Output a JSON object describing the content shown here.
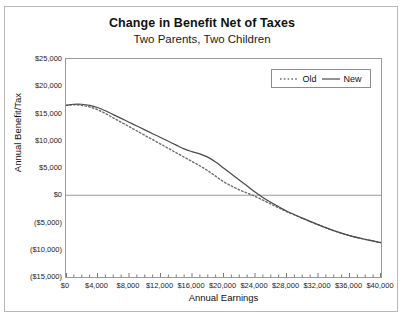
{
  "chart_data": {
    "type": "line",
    "title": "Change in Benefit Net of Taxes",
    "subtitle": "Two Parents, Two Children",
    "xlabel": "Annual Earnings",
    "ylabel": "Annual Benefit/Tax",
    "xlim": [
      0,
      40000
    ],
    "ylim": [
      -15000,
      25000
    ],
    "grid": false,
    "legend_position": "top-right",
    "x_tick_labels": [
      "$0",
      "$4,000",
      "$8,000",
      "$12,000",
      "$16,000",
      "$20,000",
      "$24,000",
      "$28,000",
      "$32,000",
      "$36,000",
      "$40,000"
    ],
    "x_tick_values": [
      0,
      4000,
      8000,
      12000,
      16000,
      20000,
      24000,
      28000,
      32000,
      36000,
      40000
    ],
    "x_minor_tick_interval": 1000,
    "y_tick_labels": [
      "$25,000",
      "$20,000",
      "$15,000",
      "$10,000",
      "$5,000",
      "$0",
      "($5,000)",
      "($10,000)",
      "($15,000)"
    ],
    "y_tick_values": [
      25000,
      20000,
      15000,
      10000,
      5000,
      0,
      -5000,
      -10000,
      -15000
    ],
    "zero_line": 0,
    "series": [
      {
        "name": "Old",
        "style": "dotted",
        "color": "#6e6e6e",
        "x": [
          0,
          1000,
          2000,
          3000,
          4000,
          5000,
          6000,
          7000,
          8000,
          9000,
          10000,
          11000,
          12000,
          13000,
          14000,
          15000,
          16000,
          17000,
          18000,
          19000,
          20000,
          21000,
          22000,
          23000,
          24000,
          25000,
          26000,
          27000,
          28000,
          30000,
          32000,
          34000,
          36000,
          38000,
          40000
        ],
        "y": [
          16500,
          16600,
          16500,
          16200,
          15700,
          15000,
          14200,
          13400,
          12600,
          11800,
          11000,
          10200,
          9400,
          8600,
          7800,
          7000,
          6200,
          5400,
          4500,
          3500,
          2500,
          1700,
          1000,
          400,
          -200,
          -900,
          -1600,
          -2300,
          -3000,
          -4200,
          -5400,
          -6500,
          -7400,
          -8100,
          -8700
        ]
      },
      {
        "name": "New",
        "style": "solid",
        "color": "#4a4a4a",
        "x": [
          0,
          1000,
          2000,
          3000,
          4000,
          5000,
          6000,
          7000,
          8000,
          9000,
          10000,
          11000,
          12000,
          13000,
          14000,
          15000,
          16000,
          17000,
          18000,
          19000,
          20000,
          21000,
          22000,
          23000,
          24000,
          25000,
          26000,
          27000,
          28000,
          30000,
          32000,
          34000,
          36000,
          38000,
          40000
        ],
        "y": [
          16500,
          16700,
          16700,
          16500,
          16100,
          15500,
          14800,
          14100,
          13400,
          12700,
          12000,
          11300,
          10600,
          9900,
          9200,
          8500,
          8000,
          7600,
          7000,
          6100,
          5000,
          3900,
          2800,
          1700,
          600,
          -400,
          -1300,
          -2100,
          -2900,
          -4200,
          -5400,
          -6500,
          -7400,
          -8100,
          -8700
        ]
      }
    ]
  },
  "legend": {
    "items": [
      {
        "label": "Old"
      },
      {
        "label": "New"
      }
    ]
  }
}
